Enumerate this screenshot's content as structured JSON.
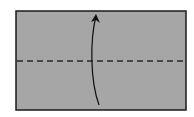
{
  "diagram": {
    "type": "origami-fold-step",
    "paper": {
      "x": 16,
      "y": 11,
      "width": 170,
      "height": 99,
      "fill": "#a6a6a6",
      "stroke": "#1a1a1a"
    },
    "fold_line": {
      "style": "dashed",
      "kind": "valley-fold",
      "y": 61,
      "x1": 16,
      "x2": 186,
      "color": "#2a2a2a"
    },
    "arrow": {
      "direction": "up",
      "meaning": "fold bottom half up",
      "color": "#111111"
    }
  }
}
